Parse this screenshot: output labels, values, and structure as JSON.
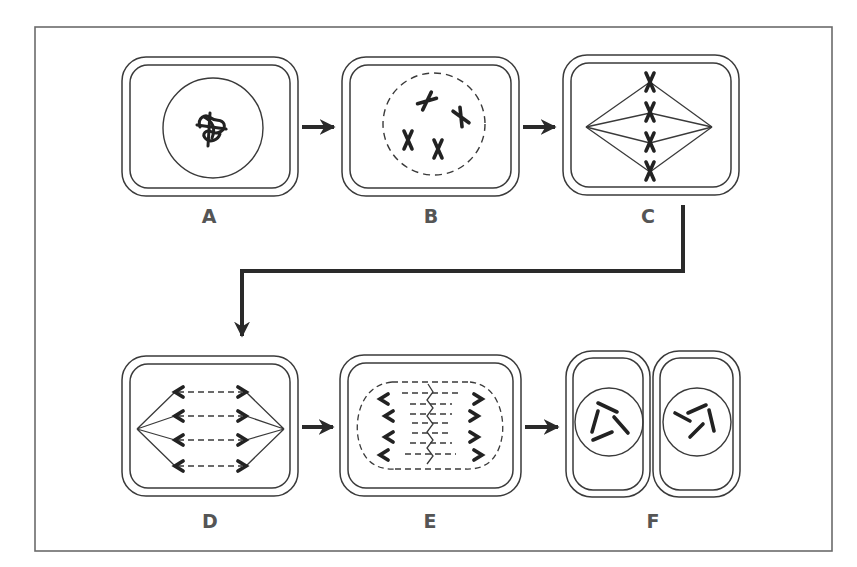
{
  "diagram": {
    "type": "cell-division-sequence",
    "colors": {
      "stroke": "#3a3a3a",
      "frame": "#6b6b6b",
      "label": "#555555",
      "chromosome": "#222222",
      "background": "#ffffff"
    },
    "stages": [
      {
        "id": "A",
        "label": "A",
        "description": "interphase: nucleus with tangled chromatin"
      },
      {
        "id": "B",
        "label": "B",
        "description": "prophase: dashed nuclear envelope, four condensed chromosomes"
      },
      {
        "id": "C",
        "label": "C",
        "description": "metaphase: four chromosomes aligned on spindle"
      },
      {
        "id": "D",
        "label": "D",
        "description": "anaphase: chromatids pulled to poles"
      },
      {
        "id": "E",
        "label": "E",
        "description": "telophase: chromatids at poles, new envelopes forming"
      },
      {
        "id": "F",
        "label": "F",
        "description": "cytokinesis: two daughter cells"
      }
    ],
    "flow": [
      "A",
      "B",
      "C",
      "D",
      "E",
      "F"
    ]
  }
}
